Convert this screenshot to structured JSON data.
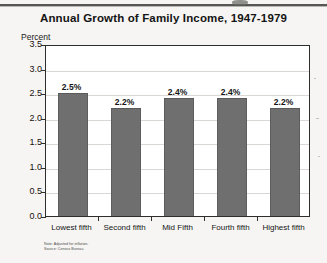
{
  "chart_data": {
    "type": "bar",
    "title": "Annual Growth of Family Income, 1947-1979",
    "ylabel": "Percent",
    "xlabel": "",
    "categories": [
      "Lowest fifth",
      "Second fifth",
      "Mid Fifth",
      "Fourth fifth",
      "Highest fifth"
    ],
    "values": [
      2.5,
      2.2,
      2.4,
      2.4,
      2.2
    ],
    "value_labels": [
      "2.5%",
      "2.2%",
      "2.4%",
      "2.4%",
      "2.2%"
    ],
    "ylim": [
      0.0,
      3.5
    ],
    "ytick_labels": [
      "0.0",
      "0.5",
      "1.0",
      "1.5",
      "2.0",
      "2.5",
      "3.0",
      "3.5"
    ],
    "ytick_values": [
      0.0,
      0.5,
      1.0,
      1.5,
      2.0,
      2.5,
      3.0,
      3.5
    ],
    "grid": true,
    "legend": "none",
    "bar_color": "#6f6f6f",
    "plot_background": "#ffffff",
    "page_background": "#f6f5f3"
  },
  "footnote": {
    "line1": "Note: Adjusted for inflation.",
    "line2": "Source: Census Bureau."
  }
}
